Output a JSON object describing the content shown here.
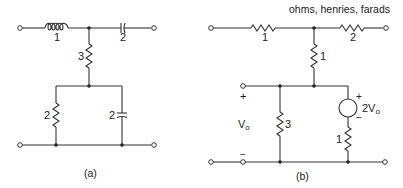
{
  "units_note": "ohms, henries, farads",
  "panels": [
    {
      "id": "a",
      "caption": "(a)",
      "components": [
        {
          "type": "inductor",
          "value": "1",
          "position": "series-top-left"
        },
        {
          "type": "capacitor",
          "value": "2",
          "position": "series-top-right"
        },
        {
          "type": "resistor",
          "value": "3",
          "position": "shunt-middle"
        },
        {
          "type": "resistor",
          "value": "2",
          "position": "shunt-bottom-left"
        },
        {
          "type": "capacitor",
          "value": "2",
          "position": "shunt-bottom-right"
        }
      ]
    },
    {
      "id": "b",
      "caption": "(b)",
      "components": [
        {
          "type": "resistor",
          "value": "1",
          "position": "series-top-left"
        },
        {
          "type": "resistor",
          "value": "2",
          "position": "series-top-right"
        },
        {
          "type": "resistor",
          "value": "1",
          "position": "shunt-middle"
        },
        {
          "type": "resistor",
          "value": "3",
          "position": "shunt-across-Vo"
        },
        {
          "type": "dependent-voltage-source",
          "value": "2Vo",
          "position": "shunt-right"
        },
        {
          "type": "resistor",
          "value": "1",
          "position": "series-with-source"
        }
      ],
      "port": {
        "label": "V",
        "subscript": "o",
        "plus": "+",
        "minus": "−"
      },
      "source_label": {
        "prefix": "2V",
        "subscript": "o",
        "plus": "+",
        "minus": "−"
      }
    }
  ]
}
